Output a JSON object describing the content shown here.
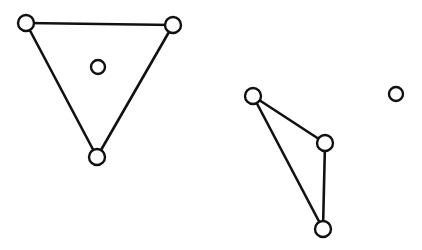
{
  "diagram": {
    "stroke_color": "#111111",
    "fill_color": "#ffffff",
    "nodes": [
      {
        "id": "a",
        "x": 26,
        "y": 23,
        "r": 8
      },
      {
        "id": "b",
        "x": 173,
        "y": 25,
        "r": 8
      },
      {
        "id": "c",
        "x": 97,
        "y": 157,
        "r": 8
      },
      {
        "id": "d",
        "x": 98,
        "y": 67,
        "r": 7
      },
      {
        "id": "e",
        "x": 253,
        "y": 96,
        "r": 8
      },
      {
        "id": "f",
        "x": 325,
        "y": 143,
        "r": 8
      },
      {
        "id": "g",
        "x": 323,
        "y": 229,
        "r": 8
      },
      {
        "id": "h",
        "x": 396,
        "y": 94,
        "r": 7
      }
    ],
    "edges": [
      [
        "a",
        "b"
      ],
      [
        "a",
        "c"
      ],
      [
        "b",
        "c"
      ],
      [
        "e",
        "f"
      ],
      [
        "e",
        "g"
      ],
      [
        "f",
        "g"
      ]
    ]
  }
}
